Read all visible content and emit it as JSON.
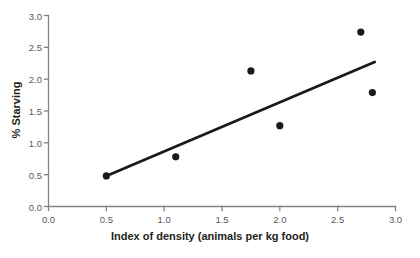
{
  "chart_data": {
    "type": "scatter",
    "title": "",
    "xlabel": "Index of density (animals per kg food)",
    "ylabel": "% Starving",
    "xlim": [
      0.0,
      3.0
    ],
    "ylim": [
      0.0,
      3.0
    ],
    "grid": false,
    "legend": "none",
    "xticks": [
      "0.0",
      "0.5",
      "1.0",
      "1.5",
      "2.0",
      "2.5",
      "3.0"
    ],
    "xtick_values": [
      0.0,
      0.5,
      1.0,
      1.5,
      2.0,
      2.5,
      3.0
    ],
    "yticks": [
      "0.0",
      "0.5",
      "1.0",
      "1.5",
      "2.0",
      "2.5",
      "3.0"
    ],
    "ytick_values": [
      0.0,
      0.5,
      1.0,
      1.5,
      2.0,
      2.5,
      3.0
    ],
    "series": [
      {
        "name": "observations",
        "marker": "filled-circle",
        "color": "#1a1a1a",
        "points": [
          {
            "x": 0.5,
            "y": 0.48
          },
          {
            "x": 1.1,
            "y": 0.78
          },
          {
            "x": 1.75,
            "y": 2.13
          },
          {
            "x": 2.0,
            "y": 1.27
          },
          {
            "x": 2.7,
            "y": 2.74
          },
          {
            "x": 2.8,
            "y": 1.79
          }
        ]
      },
      {
        "name": "trend-line",
        "type": "line",
        "color": "#1a1a1a",
        "points": [
          {
            "x": 0.5,
            "y": 0.48
          },
          {
            "x": 2.82,
            "y": 2.27
          }
        ]
      }
    ],
    "colors": {
      "axis": "#808285",
      "marker": "#1a1a1a",
      "trend_line": "#1a1a1a",
      "tick_text": "#58595b",
      "title_text": "#231f20",
      "background": "#ffffff"
    }
  }
}
